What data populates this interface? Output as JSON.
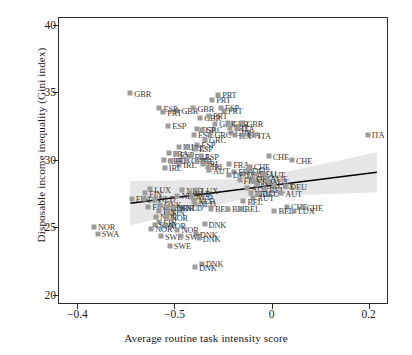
{
  "chart_data": {
    "type": "scatter",
    "title": "",
    "xlabel": "Average routine task intensity score",
    "ylabel": "Disposable income inequality (Gini index)",
    "xlim": [
      -0.44,
      0.24
    ],
    "ylim": [
      19.3,
      40.6
    ],
    "xticks": [
      "-0.4",
      "-0.5",
      "0",
      "0.2"
    ],
    "xtick_values": [
      -0.4,
      -0.2,
      0,
      0.2
    ],
    "yticks": [
      "20",
      "25",
      "30",
      "35",
      "40"
    ],
    "ytick_values": [
      20,
      25,
      30,
      35,
      40
    ],
    "grid": false,
    "legend": null,
    "marker_color": "#9c9c9c",
    "line_color": "#000000",
    "band_color": "#e3e3e3",
    "trend": {
      "type": "linear-fit-with-confidence-band",
      "x_start": -0.293,
      "y_start": 26.85,
      "x_end": 0.215,
      "y_end": 29.15
    },
    "points": [
      {
        "label": "GBR",
        "x": -0.293,
        "y": 35.0
      },
      {
        "label": "GBR",
        "x": -0.196,
        "y": 33.7
      },
      {
        "label": "GBR",
        "x": -0.163,
        "y": 33.9
      },
      {
        "label": "GBR",
        "x": -0.149,
        "y": 33.2
      },
      {
        "label": "ESP",
        "x": -0.106,
        "y": 33.95
      },
      {
        "label": "PRT",
        "x": -0.1,
        "y": 33.7
      },
      {
        "label": "PRT",
        "x": -0.124,
        "y": 34.55
      },
      {
        "label": "PRT",
        "x": -0.112,
        "y": 34.9
      },
      {
        "label": "PRT",
        "x": -0.131,
        "y": 33.35
      },
      {
        "label": "GBR",
        "x": -0.118,
        "y": 32.75
      },
      {
        "label": "GBR",
        "x": -0.092,
        "y": 32.78
      },
      {
        "label": "GBR",
        "x": -0.062,
        "y": 32.8
      },
      {
        "label": "PRT",
        "x": -0.088,
        "y": 32.45
      },
      {
        "label": "ITA",
        "x": -0.072,
        "y": 32.4
      },
      {
        "label": "GBR",
        "x": -0.085,
        "y": 32.1
      },
      {
        "label": "ITA",
        "x": -0.078,
        "y": 31.9
      },
      {
        "label": "ITA",
        "x": -0.06,
        "y": 31.92
      },
      {
        "label": "ITA",
        "x": -0.038,
        "y": 31.88
      },
      {
        "label": "ITA",
        "x": 0.196,
        "y": 31.95
      },
      {
        "label": "ESP",
        "x": -0.233,
        "y": 33.9
      },
      {
        "label": "PRT",
        "x": -0.225,
        "y": 33.6
      },
      {
        "label": "ESP",
        "x": -0.215,
        "y": 32.6
      },
      {
        "label": "ESP",
        "x": -0.155,
        "y": 32.35
      },
      {
        "label": "ESP",
        "x": -0.162,
        "y": 31.95
      },
      {
        "label": "GRC",
        "x": -0.146,
        "y": 32.3
      },
      {
        "label": "GRC",
        "x": -0.128,
        "y": 31.95
      },
      {
        "label": "GRC",
        "x": -0.139,
        "y": 31.55
      },
      {
        "label": "ESP",
        "x": -0.155,
        "y": 31.2
      },
      {
        "label": "IRL",
        "x": -0.193,
        "y": 31.05
      },
      {
        "label": "IRL",
        "x": -0.176,
        "y": 31.02
      },
      {
        "label": "ESP",
        "x": -0.16,
        "y": 30.9
      },
      {
        "label": "FRA",
        "x": -0.214,
        "y": 30.55
      },
      {
        "label": "ESP",
        "x": -0.199,
        "y": 30.5
      },
      {
        "label": "CHE",
        "x": -0.224,
        "y": 30.05
      },
      {
        "label": "IRL",
        "x": -0.209,
        "y": 30.02
      },
      {
        "label": "IRL",
        "x": -0.192,
        "y": 29.7
      },
      {
        "label": "FRA",
        "x": -0.169,
        "y": 30.35
      },
      {
        "label": "ESP",
        "x": -0.148,
        "y": 30.35
      },
      {
        "label": "CHE",
        "x": -0.176,
        "y": 30.05
      },
      {
        "label": "IRL",
        "x": -0.156,
        "y": 30.0
      },
      {
        "label": "IRL",
        "x": -0.143,
        "y": 29.8
      },
      {
        "label": "IRL",
        "x": -0.134,
        "y": 29.55
      },
      {
        "label": "IRL",
        "x": -0.222,
        "y": 29.5
      },
      {
        "label": "AUT",
        "x": -0.131,
        "y": 29.3
      },
      {
        "label": "FRA",
        "x": -0.089,
        "y": 29.75
      },
      {
        "label": "CHE",
        "x": -0.008,
        "y": 30.35
      },
      {
        "label": "CHE",
        "x": 0.04,
        "y": 30.05
      },
      {
        "label": "CHE",
        "x": -0.047,
        "y": 29.55
      },
      {
        "label": "FRA",
        "x": -0.079,
        "y": 29.2
      },
      {
        "label": "DEU",
        "x": -0.05,
        "y": 29.3
      },
      {
        "label": "DEU",
        "x": -0.062,
        "y": 29.0
      },
      {
        "label": "DEU",
        "x": -0.035,
        "y": 29.05
      },
      {
        "label": "DEU",
        "x": -0.09,
        "y": 28.95
      },
      {
        "label": "AUT",
        "x": -0.017,
        "y": 28.95
      },
      {
        "label": "DEU",
        "x": -0.042,
        "y": 28.7
      },
      {
        "label": "AUT",
        "x": -0.013,
        "y": 28.7
      },
      {
        "label": "FRA",
        "x": -0.068,
        "y": 28.55
      },
      {
        "label": "FRA",
        "x": -0.039,
        "y": 28.5
      },
      {
        "label": "AUT",
        "x": -0.01,
        "y": 28.45
      },
      {
        "label": "LUX",
        "x": -0.033,
        "y": 28.2
      },
      {
        "label": "LUX",
        "x": 0.002,
        "y": 28.15
      },
      {
        "label": "DEU",
        "x": 0.028,
        "y": 28.1
      },
      {
        "label": "AUT",
        "x": -0.052,
        "y": 27.95
      },
      {
        "label": "BEL",
        "x": -0.015,
        "y": 27.9
      },
      {
        "label": "BEL",
        "x": -0.045,
        "y": 27.6
      },
      {
        "label": "DEU",
        "x": -0.029,
        "y": 27.55
      },
      {
        "label": "AUT",
        "x": 0.018,
        "y": 27.6
      },
      {
        "label": "AUT",
        "x": -0.04,
        "y": 27.25
      },
      {
        "label": "BEL",
        "x": -0.06,
        "y": 27.0
      },
      {
        "label": "CHE",
        "x": 0.03,
        "y": 26.6
      },
      {
        "label": "CHE",
        "x": 0.062,
        "y": 26.55
      },
      {
        "label": "BEL",
        "x": 0.004,
        "y": 26.3
      },
      {
        "label": "LUX",
        "x": 0.044,
        "y": 26.3
      },
      {
        "label": "LUX",
        "x": -0.252,
        "y": 27.9
      },
      {
        "label": "FIN",
        "x": -0.263,
        "y": 27.6
      },
      {
        "label": "FIN",
        "x": -0.29,
        "y": 27.2
      },
      {
        "label": "FIN",
        "x": -0.265,
        "y": 27.15
      },
      {
        "label": "NLD",
        "x": -0.243,
        "y": 27.2
      },
      {
        "label": "NLD",
        "x": -0.186,
        "y": 27.8
      },
      {
        "label": "LUX",
        "x": -0.155,
        "y": 27.8
      },
      {
        "label": "NLD",
        "x": -0.17,
        "y": 27.55
      },
      {
        "label": "NLD",
        "x": -0.196,
        "y": 27.4
      },
      {
        "label": "NLD",
        "x": -0.166,
        "y": 27.35
      },
      {
        "label": "NLD",
        "x": -0.162,
        "y": 27.05
      },
      {
        "label": "NLD",
        "x": -0.16,
        "y": 26.8
      },
      {
        "label": "NLD",
        "x": -0.187,
        "y": 26.5
      },
      {
        "label": "FIN",
        "x": -0.256,
        "y": 26.6
      },
      {
        "label": "DNK",
        "x": -0.232,
        "y": 26.75
      },
      {
        "label": "NOR",
        "x": -0.218,
        "y": 26.55
      },
      {
        "label": "NOR",
        "x": -0.205,
        "y": 26.5
      },
      {
        "label": "FIN",
        "x": -0.234,
        "y": 26.25
      },
      {
        "label": "FIN",
        "x": -0.216,
        "y": 26.2
      },
      {
        "label": "BEL",
        "x": -0.127,
        "y": 26.45
      },
      {
        "label": "BEL",
        "x": -0.092,
        "y": 26.45
      },
      {
        "label": "BEL",
        "x": -0.066,
        "y": 26.45
      },
      {
        "label": "NOR",
        "x": -0.24,
        "y": 25.85
      },
      {
        "label": "NOR",
        "x": -0.218,
        "y": 25.8
      },
      {
        "label": "FIN",
        "x": -0.233,
        "y": 25.45
      },
      {
        "label": "SWE",
        "x": -0.243,
        "y": 25.25
      },
      {
        "label": "NOR",
        "x": -0.222,
        "y": 25.2
      },
      {
        "label": "NOR",
        "x": -0.25,
        "y": 24.95
      },
      {
        "label": "NOR",
        "x": -0.196,
        "y": 24.9
      },
      {
        "label": "DNK",
        "x": -0.14,
        "y": 25.3
      },
      {
        "label": "DNK",
        "x": -0.158,
        "y": 24.55
      },
      {
        "label": "SWE",
        "x": -0.23,
        "y": 24.4
      },
      {
        "label": "SWE",
        "x": -0.188,
        "y": 24.4
      },
      {
        "label": "DNK",
        "x": -0.152,
        "y": 24.25
      },
      {
        "label": "SWE",
        "x": -0.212,
        "y": 23.7
      },
      {
        "label": "DNK",
        "x": -0.146,
        "y": 22.35
      },
      {
        "label": "DNK",
        "x": -0.16,
        "y": 22.1
      },
      {
        "label": "NOR",
        "x": -0.368,
        "y": 25.1
      },
      {
        "label": "SWA",
        "x": -0.36,
        "y": 24.6
      }
    ]
  }
}
